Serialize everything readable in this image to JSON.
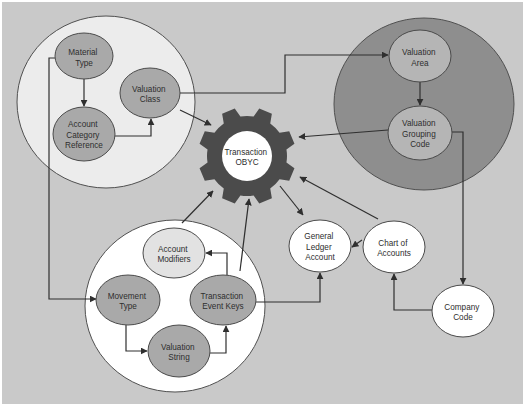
{
  "colors": {
    "canvas_background": "#c9c9c9",
    "page_background": "#ffffff",
    "gear": "#4b4b4b",
    "gear_center": "#ffffff",
    "group_material": "#ececec",
    "group_valuation_area": "#8e8e8e",
    "group_movement": "#ffffff",
    "node_medium_gray": "#a9a9a9",
    "node_light_gray": "#b5b5b5",
    "node_pale_gray": "#e2e2e2",
    "node_white": "#ffffff",
    "line": "#2f2f2f"
  },
  "hub": {
    "icon": "gear-icon",
    "lines": [
      "Transaction",
      "OBYC"
    ]
  },
  "groups": [
    {
      "id": "material_group",
      "contains": [
        "material_type",
        "account_category_reference",
        "valuation_class"
      ]
    },
    {
      "id": "valuation_area_group",
      "contains": [
        "valuation_area",
        "valuation_grouping_code"
      ]
    },
    {
      "id": "movement_group",
      "contains": [
        "account_modifiers",
        "movement_type",
        "transaction_event_keys",
        "valuation_string"
      ]
    }
  ],
  "nodes": {
    "material_type": {
      "lines": [
        "Material",
        "Type"
      ]
    },
    "account_category_reference": {
      "lines": [
        "Account",
        "Category",
        "Reference"
      ]
    },
    "valuation_class": {
      "lines": [
        "Valuation",
        "Class"
      ]
    },
    "valuation_area": {
      "lines": [
        "Valuation",
        "Area"
      ]
    },
    "valuation_grouping_code": {
      "lines": [
        "Valuation",
        "Grouping",
        "Code"
      ]
    },
    "account_modifiers": {
      "lines": [
        "Account",
        "Modifiers"
      ]
    },
    "movement_type": {
      "lines": [
        "Movement",
        "Type"
      ]
    },
    "transaction_event_keys": {
      "lines": [
        "Transaction",
        "Event Keys"
      ]
    },
    "valuation_string": {
      "lines": [
        "Valuation",
        "String"
      ]
    },
    "general_ledger_account": {
      "lines": [
        "General",
        "Ledger",
        "Account"
      ]
    },
    "chart_of_accounts": {
      "lines": [
        "Chart of",
        "Accounts"
      ]
    },
    "company_code": {
      "lines": [
        "Company",
        "Code"
      ]
    }
  },
  "edges": [
    {
      "from": "material_type",
      "to": "account_category_reference"
    },
    {
      "from": "account_category_reference",
      "to": "valuation_class"
    },
    {
      "from": "material_type",
      "to": "movement_type"
    },
    {
      "from": "valuation_class",
      "to": "valuation_area"
    },
    {
      "from": "valuation_class",
      "to": "hub"
    },
    {
      "from": "valuation_area",
      "to": "valuation_grouping_code"
    },
    {
      "from": "valuation_grouping_code",
      "to": "hub"
    },
    {
      "from": "valuation_grouping_code",
      "to": "company_code"
    },
    {
      "from": "company_code",
      "to": "chart_of_accounts"
    },
    {
      "from": "chart_of_accounts",
      "to": "general_ledger_account"
    },
    {
      "from": "chart_of_accounts",
      "to": "hub"
    },
    {
      "from": "hub",
      "to": "general_ledger_account"
    },
    {
      "from": "movement_group",
      "to": "hub"
    },
    {
      "from": "transaction_event_keys",
      "to": "account_modifiers"
    },
    {
      "from": "transaction_event_keys",
      "to": "hub"
    },
    {
      "from": "movement_type",
      "to": "valuation_string"
    },
    {
      "from": "valuation_string",
      "to": "transaction_event_keys"
    },
    {
      "from": "transaction_event_keys",
      "to": "general_ledger_account"
    }
  ]
}
